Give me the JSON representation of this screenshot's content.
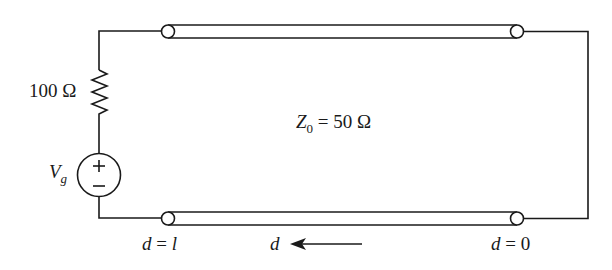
{
  "diagram": {
    "type": "transmission-line-circuit",
    "resistor": {
      "label": "100 Ω"
    },
    "source": {
      "symbol": "V",
      "subscript": "g",
      "plus": "+",
      "minus": "−"
    },
    "line": {
      "impedance_symbol": "Z",
      "impedance_subscript": "0",
      "impedance_value": " = 50 Ω"
    },
    "positions": {
      "left_end": {
        "var": "d",
        "eq": " = ",
        "val": "l"
      },
      "right_end": {
        "var": "d",
        "eq": " = ",
        "val": "0"
      },
      "direction": {
        "var": "d"
      }
    },
    "stroke_color": "#1a1a1a"
  }
}
